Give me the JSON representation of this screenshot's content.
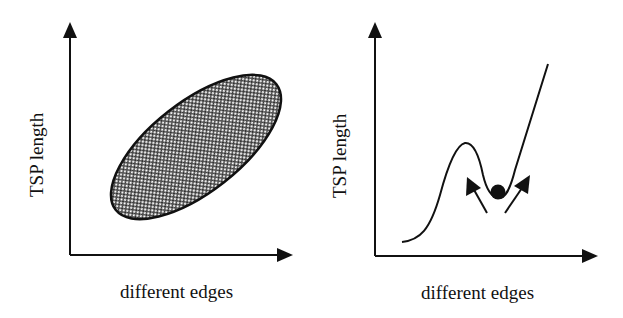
{
  "panels": [
    {
      "id": "left",
      "xlabel": "different edges",
      "ylabel": "TSP length",
      "shape": "hatched-ellipse",
      "description": "Correlation: TSP length increases with number of different edges"
    },
    {
      "id": "right",
      "xlabel": "different edges",
      "ylabel": "TSP length",
      "shape": "curve-with-local-minimum",
      "description": "Ball resting in local minimum with arrows pointing out of the valley"
    }
  ],
  "colors": {
    "ink": "#111111",
    "background": "#ffffff"
  }
}
